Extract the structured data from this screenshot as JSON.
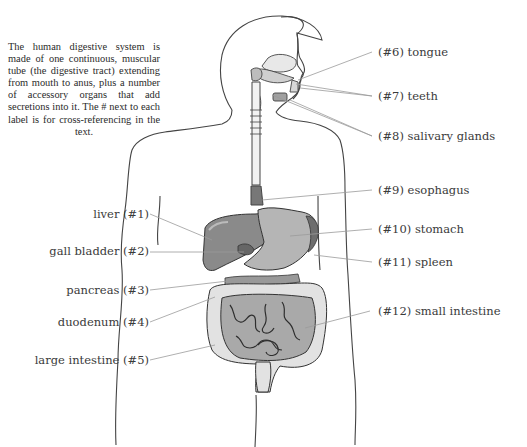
{
  "intro_text": "The human digestive system is made of one continuous, muscular tube (the digestive tract) extending from mouth to anus, plus a number of accessory organs that add secretions into it. The # next to each label is for cross-referencing in the text.",
  "labels_left": [
    {
      "id": 1,
      "text": "liver (#1)"
    },
    {
      "id": 2,
      "text": "gall bladder (#2)"
    },
    {
      "id": 3,
      "text": "pancreas (#3)"
    },
    {
      "id": 4,
      "text": "duodenum (#4)"
    },
    {
      "id": 5,
      "text": "large intestine (#5)"
    }
  ],
  "labels_right": [
    {
      "id": 6,
      "text": "(#6) tongue"
    },
    {
      "id": 7,
      "text": "(#7) teeth"
    },
    {
      "id": 8,
      "text": "(#8) salivary glands"
    },
    {
      "id": 9,
      "text": "(#9) esophagus"
    },
    {
      "id": 10,
      "text": "(#10) stomach"
    },
    {
      "id": 11,
      "text": "(#11) spleen"
    },
    {
      "id": 12,
      "text": "(#12) small intestine"
    }
  ],
  "colors": {
    "outline": "#444444",
    "leader": "#9a9a9a",
    "liver": "#8a8a8a",
    "stomach": "#b5b5b5",
    "spleen": "#6e6e6e",
    "small_intestine": "#a9a9a9",
    "large_intestine": "#e2e2e2"
  }
}
